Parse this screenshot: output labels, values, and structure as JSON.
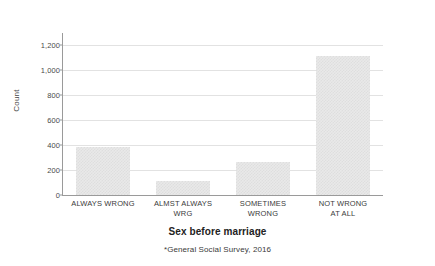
{
  "chart_data": {
    "type": "bar",
    "title": "",
    "xlabel": "Sex before marriage",
    "ylabel": "Count",
    "footnote": "*General Social Survey, 2016",
    "categories": [
      "ALWAYS WRONG",
      "ALMST ALWAYS WRG",
      "SOMETIMES WRONG",
      "NOT WRONG AT ALL"
    ],
    "category_lines": [
      [
        "ALWAYS WRONG",
        ""
      ],
      [
        "ALMST ALWAYS",
        "WRG"
      ],
      [
        "SOMETIMES",
        "WRONG"
      ],
      [
        "NOT WRONG",
        "AT ALL"
      ]
    ],
    "values": [
      382,
      110,
      268,
      1110
    ],
    "ylim": [
      0,
      1280
    ],
    "yticks": [
      0,
      200,
      400,
      600,
      800,
      1000,
      1200
    ],
    "ytick_labels": [
      "0",
      "200",
      "400",
      "600",
      "800",
      "1,000",
      "1,200"
    ],
    "grid": true,
    "legend": "none",
    "bar_color": "#e9e9e9",
    "grid_color": "#e2e2e2",
    "axis_color": "#9a9a9a",
    "background": "#ffffff"
  }
}
